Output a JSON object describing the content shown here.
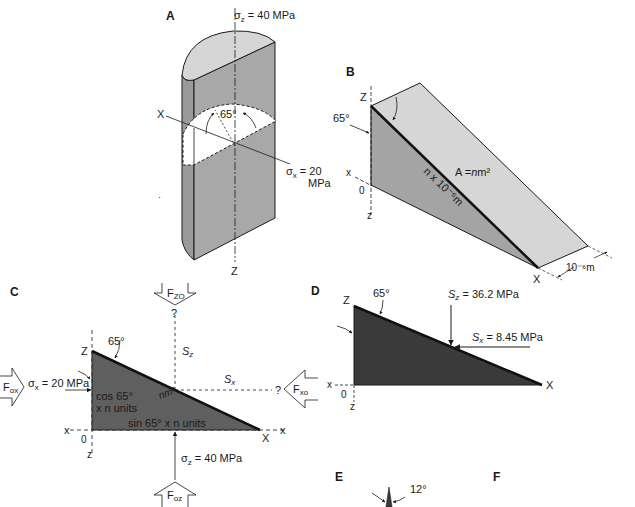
{
  "panels": {
    "A": {
      "label": "A",
      "sigma_z": "σz = 40 MPa",
      "sigma_z_sym": "σ",
      "sigma_z_sub": "z",
      "sigma_z_val": " = 40 MPa",
      "axis_x": "X",
      "axis_z": "Z",
      "angle": "65°",
      "sigma_x_sym": "σ",
      "sigma_x_sub": "x",
      "sigma_x_val": " = 20",
      "sigma_x_unit": "MPa"
    },
    "B": {
      "label": "B",
      "axis_Z": "Z",
      "axis_X": "X",
      "axis_x": "x",
      "axis_z": "z",
      "origin": "0",
      "angle": "65°",
      "area": "A = nm²",
      "area_A": "A =",
      "area_n": "n",
      "area_m2": "m²",
      "edge_length": "n x 10⁻⁶m",
      "depth": "10⁻⁶m"
    },
    "C": {
      "label": "C",
      "axis_Z": "Z",
      "axis_X": "X",
      "axis_x_left": "x",
      "axis_x_right": "x",
      "axis_z": "z",
      "origin": "0",
      "angle": "65°",
      "F_zo": "F",
      "F_zo_sub": "ZO",
      "F_ox": "F",
      "F_ox_sub": "ox",
      "F_xo": "F",
      "F_xo_sub": "xo",
      "F_oz": "F",
      "F_oz_sub": "oz",
      "q_top": "?",
      "q_right": "?",
      "S_z": "S",
      "S_z_sub": "z",
      "S_x": "S",
      "S_x_sub": "x",
      "sigma_x": "σx = 20 MPa",
      "sigma_x_sym": "σ",
      "sigma_x_sub": "x",
      "sigma_x_val": " = 20 MPa",
      "sigma_z_sym": "σ",
      "sigma_z_sub": "z",
      "sigma_z_val": " = 40 MPa",
      "cos_line1": "cos 65°",
      "cos_line2": "x n units",
      "sin_label": "sin 65° x n units",
      "hyp_area": "nm²"
    },
    "D": {
      "label": "D",
      "axis_Z": "Z",
      "axis_X": "X",
      "axis_x": "x",
      "axis_z": "z",
      "origin": "0",
      "angle": "65°",
      "S_z": "S",
      "S_z_sub": "z",
      "S_z_val": " = 36.2 MPa",
      "S_x": "S",
      "S_x_sub": "x",
      "S_x_val": " = 8.45 MPa"
    },
    "E": {
      "label": "E",
      "angle": "12°"
    },
    "F": {
      "label": "F"
    }
  },
  "colors": {
    "light_face": "#d4d4d4",
    "mid_face": "#a6a6a6",
    "dark_fill": "#3a3a3a",
    "c_fill": "#5e5e5e",
    "line": "#1a1a1a"
  }
}
